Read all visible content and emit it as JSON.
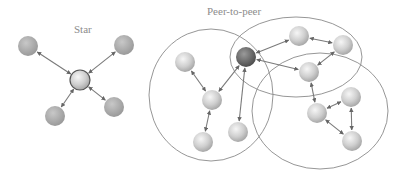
{
  "titles": {
    "star": "Star",
    "p2p": "Peer-to-peer"
  },
  "colors": {
    "node_light": "#d8d8d8",
    "node_mid": "#a9a9a9",
    "node_dark": "#6e6e6e",
    "edge": "#7a7a7a",
    "circle": "#8a8a8a",
    "title": "#8c8c8c"
  },
  "star": {
    "center": {
      "id": "hub",
      "x": 80,
      "y": 80,
      "r": 10
    },
    "nodes": [
      {
        "id": "s1",
        "x": 28,
        "y": 46,
        "r": 10
      },
      {
        "id": "s2",
        "x": 124,
        "y": 45,
        "r": 10
      },
      {
        "id": "s3",
        "x": 55,
        "y": 116,
        "r": 10
      },
      {
        "id": "s4",
        "x": 114,
        "y": 107,
        "r": 10
      }
    ]
  },
  "p2p": {
    "groups": [
      {
        "id": "g-left",
        "cx": 211,
        "cy": 95,
        "rx": 62,
        "ry": 66
      },
      {
        "id": "g-top-right",
        "cx": 296,
        "cy": 57,
        "rx": 66,
        "ry": 40
      },
      {
        "id": "g-bottom-right",
        "cx": 320,
        "cy": 111,
        "rx": 68,
        "ry": 58
      }
    ],
    "nodes": [
      {
        "id": "p1",
        "x": 185,
        "y": 62,
        "r": 10,
        "tone": "light"
      },
      {
        "id": "p2",
        "x": 212,
        "y": 100,
        "r": 10,
        "tone": "light"
      },
      {
        "id": "p3",
        "x": 246,
        "y": 57,
        "r": 10,
        "tone": "dark"
      },
      {
        "id": "p4",
        "x": 203,
        "y": 142,
        "r": 10,
        "tone": "light"
      },
      {
        "id": "p5",
        "x": 238,
        "y": 132,
        "r": 10,
        "tone": "light"
      },
      {
        "id": "p6",
        "x": 299,
        "y": 36,
        "r": 10,
        "tone": "light"
      },
      {
        "id": "p7",
        "x": 343,
        "y": 45,
        "r": 10,
        "tone": "light"
      },
      {
        "id": "p8",
        "x": 309,
        "y": 72,
        "r": 10,
        "tone": "light"
      },
      {
        "id": "p9",
        "x": 317,
        "y": 113,
        "r": 10,
        "tone": "light"
      },
      {
        "id": "p10",
        "x": 351,
        "y": 97,
        "r": 10,
        "tone": "light"
      },
      {
        "id": "p11",
        "x": 352,
        "y": 141,
        "r": 10,
        "tone": "light"
      }
    ],
    "edges": [
      [
        "p1",
        "p2"
      ],
      [
        "p2",
        "p3"
      ],
      [
        "p2",
        "p4"
      ],
      [
        "p3",
        "p5"
      ],
      [
        "p3",
        "p6"
      ],
      [
        "p3",
        "p8"
      ],
      [
        "p6",
        "p7"
      ],
      [
        "p7",
        "p8"
      ],
      [
        "p8",
        "p9"
      ],
      [
        "p9",
        "p10"
      ],
      [
        "p10",
        "p11"
      ],
      [
        "p11",
        "p9"
      ]
    ]
  }
}
